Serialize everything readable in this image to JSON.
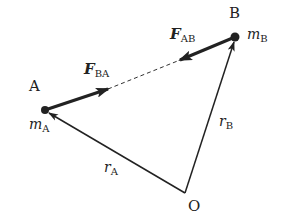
{
  "diagram": {
    "points": {
      "A": {
        "label": "A",
        "x": 45,
        "y": 110
      },
      "B": {
        "label": "B",
        "x": 235,
        "y": 37
      },
      "O": {
        "label": "O",
        "x": 185,
        "y": 193
      }
    },
    "masses": {
      "A": {
        "symbol": "m",
        "subscript": "A"
      },
      "B": {
        "symbol": "m",
        "subscript": "B"
      }
    },
    "position_vectors": {
      "rA": {
        "symbol": "r",
        "subscript": "A",
        "from": "O",
        "to": "A"
      },
      "rB": {
        "symbol": "r",
        "subscript": "B",
        "from": "O",
        "to": "B"
      }
    },
    "forces": {
      "FBA": {
        "symbol": "F",
        "subscript": "BA",
        "acts_on": "A",
        "direction": "toward B"
      },
      "FAB": {
        "symbol": "F",
        "subscript": "AB",
        "acts_on": "B",
        "direction": "toward A"
      }
    },
    "colors": {
      "stroke": "#222222",
      "background": "#ffffff"
    }
  }
}
